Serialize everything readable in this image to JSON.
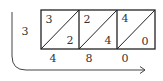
{
  "diagram": {
    "type": "lattice-multiplication",
    "multiplier_left": "3",
    "columns": [
      {
        "top_digit": "3",
        "bottom_digit": "2",
        "result_digit": "4"
      },
      {
        "top_digit": "2",
        "bottom_digit": "4",
        "result_digit": "8"
      },
      {
        "top_digit": "4",
        "bottom_digit": "0",
        "result_digit": "0"
      }
    ],
    "colors": {
      "lines": "#222222",
      "text": "#333333",
      "arrow": "#444444"
    }
  }
}
